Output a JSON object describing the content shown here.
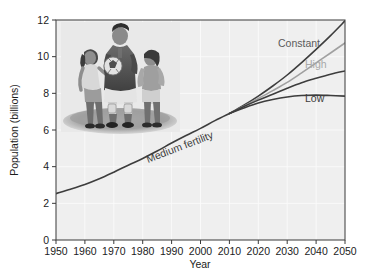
{
  "figure": {
    "background_color": "#ffffff",
    "plot_background_color": "#efefef",
    "gridline_color": "#fbfbfb",
    "axis_color": "#3a3a3a"
  },
  "axes": {
    "y_title": "Population (billions)",
    "x_title": "Year",
    "y_ticks": [
      "0",
      "2",
      "4",
      "6",
      "8",
      "10",
      "12"
    ],
    "x_ticks": [
      "1950",
      "1960",
      "1970",
      "1980",
      "1990",
      "2000",
      "2010",
      "2020",
      "2030",
      "2040",
      "2050"
    ]
  },
  "annotations": {
    "medium": {
      "label": "Medium fertility",
      "color": "#3d3d3d"
    },
    "constant": {
      "label": "Constant",
      "color": "#5a5a5a"
    },
    "high": {
      "label": "High",
      "color": "#a8a8a8"
    },
    "low": {
      "label": "Low",
      "color": "#3d3d3d"
    }
  },
  "photo": {
    "name": "three-children-with-soccer-ball-photo",
    "description": "Photograph of three children standing on a grassy mound; boy in center holding a soccer ball, a girl on each side",
    "sky_color": "#e9e9e9",
    "grass_color": "#9a9a9a"
  },
  "chart_data": {
    "type": "line",
    "title": "",
    "xlabel": "Year",
    "ylabel": "Population (billions)",
    "xlim": [
      1950,
      2050
    ],
    "ylim": [
      0,
      12
    ],
    "grid": true,
    "legend_position": "inline-annotations",
    "x": [
      1950,
      1960,
      1970,
      1980,
      1990,
      2000,
      2010,
      2020,
      2030,
      2040,
      2050
    ],
    "series": [
      {
        "name": "Medium fertility",
        "color": "#3d3d3d",
        "width": 1.6,
        "x": [
          1950,
          1955,
          1960,
          1965,
          1970,
          1975,
          1980,
          1985,
          1990,
          1995,
          2000,
          2005,
          2010
        ],
        "values": [
          2.53,
          2.77,
          3.03,
          3.34,
          3.7,
          4.08,
          4.45,
          4.85,
          5.29,
          5.7,
          6.09,
          6.51,
          6.9
        ]
      },
      {
        "name": "Constant",
        "color": "#3d3d3d",
        "width": 1.6,
        "x": [
          2010,
          2015,
          2020,
          2025,
          2030,
          2035,
          2040,
          2045,
          2050
        ],
        "values": [
          6.9,
          7.35,
          7.85,
          8.4,
          9.0,
          9.68,
          10.4,
          11.15,
          11.95
        ]
      },
      {
        "name": "High",
        "color": "#a0a0a0",
        "width": 1.6,
        "x": [
          2010,
          2015,
          2020,
          2025,
          2030,
          2035,
          2040,
          2045,
          2050
        ],
        "values": [
          6.9,
          7.3,
          7.72,
          8.15,
          8.6,
          9.12,
          9.66,
          10.2,
          10.75
        ]
      },
      {
        "name": "Medium projection",
        "color": "#3d3d3d",
        "width": 1.6,
        "x": [
          2010,
          2015,
          2020,
          2025,
          2030,
          2035,
          2040,
          2045,
          2050
        ],
        "values": [
          6.9,
          7.28,
          7.63,
          7.95,
          8.28,
          8.58,
          8.82,
          9.04,
          9.22
        ]
      },
      {
        "name": "Low",
        "color": "#3d3d3d",
        "width": 1.6,
        "x": [
          2010,
          2015,
          2020,
          2025,
          2030,
          2035,
          2040,
          2045,
          2050
        ],
        "values": [
          6.9,
          7.2,
          7.47,
          7.66,
          7.8,
          7.88,
          7.9,
          7.88,
          7.85
        ]
      }
    ]
  }
}
